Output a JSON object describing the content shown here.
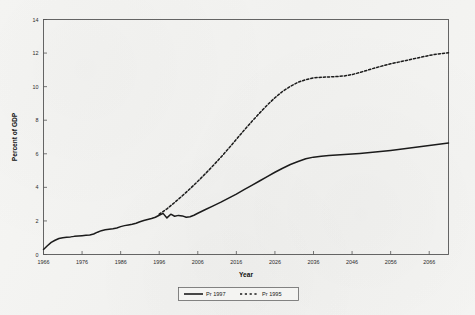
{
  "chart_data": {
    "type": "line",
    "title": "",
    "xlabel": "Year",
    "ylabel": "Percent of GDP",
    "xlim": [
      1966,
      2071
    ],
    "ylim": [
      0,
      14
    ],
    "xticks": [
      1966,
      1976,
      1986,
      1996,
      2006,
      2016,
      2026,
      2036,
      2046,
      2056,
      2066
    ],
    "yticks": [
      0,
      2,
      4,
      6,
      8,
      10,
      12,
      14
    ],
    "xtick_labels": [
      "1966",
      "1976",
      "1986",
      "1996",
      "2006",
      "2016",
      "2026",
      "2036",
      "2046",
      "2056",
      "2066"
    ],
    "ytick_labels": [
      "0",
      "2",
      "4",
      "6",
      "8",
      "10",
      "12",
      "14"
    ],
    "grid": false,
    "legend_position": "bottom-center",
    "legend_entries": [
      {
        "name": "Pr 1997",
        "style": "solid",
        "color": "#1b1b1b"
      },
      {
        "name": "Pr 1995",
        "style": "dashed",
        "color": "#1b1b1b"
      }
    ],
    "series": [
      {
        "name": "Pr 1997",
        "style": "solid",
        "color": "#1b1b1b",
        "x": [
          1966,
          1967,
          1968,
          1969,
          1970,
          1971,
          1972,
          1973,
          1974,
          1975,
          1976,
          1977,
          1978,
          1979,
          1980,
          1981,
          1982,
          1983,
          1984,
          1985,
          1986,
          1987,
          1988,
          1989,
          1990,
          1991,
          1992,
          1993,
          1994,
          1995,
          1996,
          1997,
          1998,
          1999,
          2000,
          2001,
          2002,
          2003,
          2004,
          2005,
          2006,
          2008,
          2010,
          2012,
          2014,
          2016,
          2018,
          2020,
          2022,
          2024,
          2026,
          2028,
          2030,
          2032,
          2034,
          2036,
          2038,
          2040,
          2044,
          2048,
          2052,
          2056,
          2060,
          2064,
          2068,
          2071
        ],
        "values": [
          0.3,
          0.52,
          0.72,
          0.85,
          0.95,
          1.0,
          1.03,
          1.05,
          1.08,
          1.1,
          1.12,
          1.14,
          1.16,
          1.22,
          1.33,
          1.42,
          1.47,
          1.5,
          1.53,
          1.58,
          1.66,
          1.72,
          1.76,
          1.8,
          1.86,
          1.95,
          2.02,
          2.08,
          2.14,
          2.22,
          2.34,
          2.45,
          2.18,
          2.4,
          2.28,
          2.33,
          2.3,
          2.22,
          2.25,
          2.34,
          2.46,
          2.68,
          2.9,
          3.12,
          3.36,
          3.6,
          3.86,
          4.12,
          4.38,
          4.64,
          4.9,
          5.14,
          5.36,
          5.54,
          5.7,
          5.8,
          5.86,
          5.9,
          5.96,
          6.02,
          6.1,
          6.2,
          6.32,
          6.44,
          6.56,
          6.64
        ]
      },
      {
        "name": "Pr 1995",
        "style": "dashed",
        "color": "#1b1b1b",
        "x": [
          1996,
          1998,
          2000,
          2002,
          2004,
          2006,
          2008,
          2010,
          2012,
          2014,
          2016,
          2018,
          2020,
          2022,
          2024,
          2026,
          2028,
          2030,
          2032,
          2034,
          2036,
          2038,
          2040,
          2042,
          2044,
          2046,
          2048,
          2050,
          2052,
          2054,
          2056,
          2058,
          2060,
          2062,
          2064,
          2066,
          2068,
          2071
        ],
        "values": [
          2.4,
          2.72,
          3.1,
          3.5,
          3.92,
          4.36,
          4.82,
          5.3,
          5.8,
          6.32,
          6.86,
          7.4,
          7.92,
          8.42,
          8.9,
          9.34,
          9.72,
          10.02,
          10.26,
          10.42,
          10.52,
          10.56,
          10.58,
          10.6,
          10.64,
          10.72,
          10.84,
          10.98,
          11.12,
          11.24,
          11.36,
          11.46,
          11.56,
          11.66,
          11.76,
          11.86,
          11.94,
          12.02
        ]
      }
    ]
  }
}
